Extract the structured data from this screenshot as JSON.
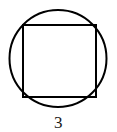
{
  "figure": {
    "kind": "circle-with-inscribed-square",
    "background_color": "#ffffff",
    "stroke_color": "#000000",
    "stroke_width_px": 2,
    "circle": {
      "center_x": 58.0,
      "center_y": 58.5,
      "radius": 48.5
    },
    "square": {
      "left": 23.0,
      "top": 25.0,
      "right": 96.0,
      "bottom": 97.0,
      "side": 73.0
    },
    "labels": {
      "side_length": "3"
    }
  }
}
